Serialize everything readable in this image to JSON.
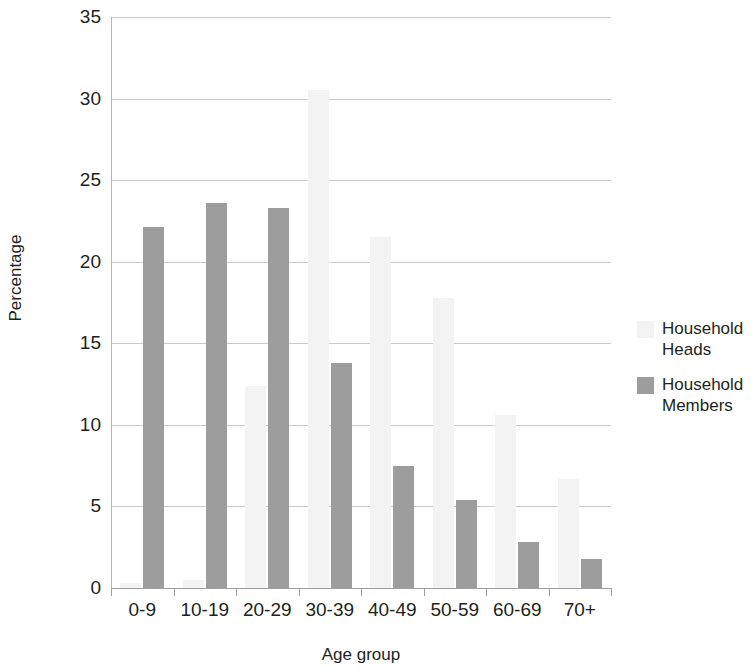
{
  "chart_data": {
    "type": "bar",
    "title": "",
    "subtitle": "",
    "xlabel": "Age group",
    "ylabel": "Percentage",
    "categories": [
      "0-9",
      "10-19",
      "20-29",
      "30-39",
      "40-49",
      "50-59",
      "60-69",
      "70+"
    ],
    "series": [
      {
        "name": "Household Heads",
        "color": "#f3f3f3",
        "values": [
          0.3,
          0.5,
          12.4,
          30.5,
          21.5,
          17.8,
          10.6,
          6.7
        ]
      },
      {
        "name": "Household Members",
        "color": "#9d9d9d",
        "values": [
          22.1,
          23.6,
          23.3,
          13.8,
          7.5,
          5.4,
          2.8,
          1.8
        ]
      }
    ],
    "ylim": [
      0,
      35
    ],
    "y_ticks": [
      0,
      5,
      10,
      15,
      20,
      25,
      30,
      35
    ],
    "y_tick_labels": [
      "0",
      "5",
      "10",
      "15",
      "20",
      "25",
      "30",
      "35"
    ],
    "grid": true,
    "grid_axis": "y",
    "legend_position": "right"
  },
  "legend": {
    "entries": [
      {
        "label_line1": "Household",
        "label_line2": "Heads"
      },
      {
        "label_line1": "Household",
        "label_line2": "Members"
      }
    ]
  }
}
